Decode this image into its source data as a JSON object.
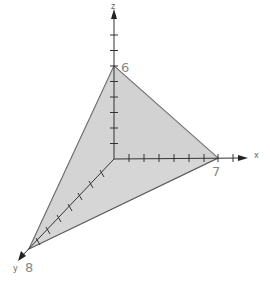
{
  "diagram": {
    "type": "3d-coordinate-plane-tetrahedron",
    "axes": {
      "x": {
        "label": "x",
        "intercept": "7",
        "ticks": 7
      },
      "y": {
        "label": "y",
        "intercept": "8",
        "ticks": 8
      },
      "z": {
        "label": "z",
        "intercept": "6",
        "ticks": 6
      }
    },
    "plane_intercepts": {
      "x": 7,
      "y": 8,
      "z": 6
    },
    "colors": {
      "fill": "#d4d4d4",
      "edge": "#555555",
      "axis": "#333333"
    }
  }
}
